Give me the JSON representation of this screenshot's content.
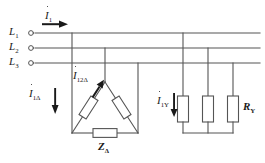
{
  "diagram": {
    "type": "electrical-schematic",
    "background_color": "#ffffff",
    "line_color": "#555555",
    "text_color": "#1a1a1a",
    "phase_lines": [
      {
        "id": "L1",
        "label": "L",
        "sub": "1",
        "y": 33
      },
      {
        "id": "L2",
        "label": "L",
        "sub": "2",
        "y": 48
      },
      {
        "id": "L3",
        "label": "L",
        "sub": "3",
        "y": 63
      }
    ],
    "current_labels": [
      {
        "id": "I1",
        "symbol": "I",
        "sub": "1",
        "arrow": "right",
        "x": 45,
        "y": 10
      },
      {
        "id": "I12D",
        "symbol": "I",
        "sub": "12Δ",
        "arrow": "up-right",
        "x": 73,
        "y": 70
      },
      {
        "id": "I1D",
        "symbol": "I",
        "sub": "1Δ",
        "arrow": "down",
        "x": 29,
        "y": 88
      },
      {
        "id": "I1Y",
        "symbol": "I",
        "sub": "1Y",
        "arrow": "down",
        "x": 157,
        "y": 95
      }
    ],
    "components": [
      {
        "id": "ZD",
        "label": "Z",
        "sub": "Δ",
        "kind": "impedance",
        "x": 105,
        "y": 146
      },
      {
        "id": "RY",
        "label": "R",
        "sub": "Y",
        "kind": "resistor",
        "x": 243,
        "y": 100
      }
    ],
    "delta_load": {
      "name": "delta-load",
      "apex": {
        "x": 105,
        "y": 82
      },
      "left_vertex": {
        "x": 72,
        "y": 133
      },
      "right_vertex": {
        "x": 138,
        "y": 133
      },
      "resistor_count": 3
    },
    "star_load": {
      "name": "star-load",
      "branch_x": [
        183,
        208,
        233
      ],
      "top_ys": [
        33,
        48,
        63
      ],
      "bottom_y": 133,
      "resistor_count": 3
    }
  }
}
